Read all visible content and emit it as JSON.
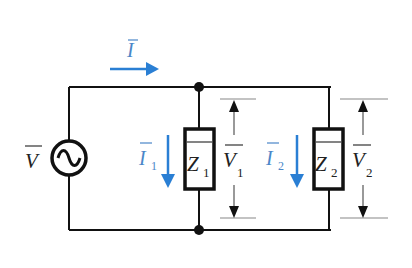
{
  "diagram": {
    "type": "parallel-ac-circuit",
    "colors": {
      "wire": "#111111",
      "current": "#2a7fd4",
      "dimension_line": "#888888",
      "text": "#222222",
      "current_text": "#4a86c8"
    },
    "source": {
      "label": "V",
      "overbar": true,
      "icon": "ac-source-icon"
    },
    "main_current": {
      "label": "I",
      "overbar": true,
      "direction": "right"
    },
    "branches": [
      {
        "impedance": {
          "label": "Z",
          "subscript": "1"
        },
        "current": {
          "label": "I",
          "subscript": "1",
          "direction": "down"
        },
        "voltage": {
          "label": "V",
          "subscript": "1"
        }
      },
      {
        "impedance": {
          "label": "Z",
          "subscript": "2"
        },
        "current": {
          "label": "I",
          "subscript": "2",
          "direction": "down"
        },
        "voltage": {
          "label": "V",
          "subscript": "2"
        }
      }
    ]
  }
}
